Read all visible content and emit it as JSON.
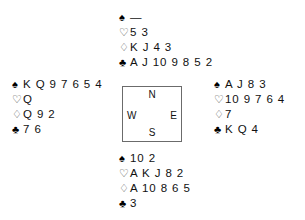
{
  "diagram": {
    "type": "bridge-deal",
    "suit_symbols": {
      "spades": "♠",
      "hearts": "♡",
      "diamonds": "♢",
      "clubs": "♣"
    },
    "void_marker": "—",
    "compass": {
      "north": "N",
      "south": "S",
      "west": "W",
      "east": "E"
    },
    "hands": {
      "north": {
        "spades": "—",
        "hearts": "5 3",
        "diamonds": "K J 4 3",
        "clubs": "A J 10 9 8 5 2"
      },
      "west": {
        "spades": "K Q 9 7 6 5 4",
        "hearts": "Q",
        "diamonds": "Q 9 2",
        "clubs": "7 6"
      },
      "east": {
        "spades": "A J 8 3",
        "hearts": "10 9 7 6 4",
        "diamonds": "7",
        "clubs": "K Q 4"
      },
      "south": {
        "spades": "10 2",
        "hearts": "A K J 8 2",
        "diamonds": "A 10 8 6 5",
        "clubs": "3"
      }
    }
  }
}
